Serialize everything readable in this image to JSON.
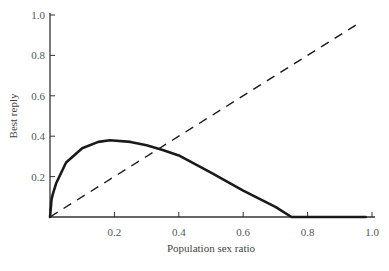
{
  "chart_data": {
    "type": "line",
    "title": "",
    "xlabel": "Population sex ratio",
    "ylabel": "Best reply",
    "xlim": [
      0,
      1.0
    ],
    "ylim": [
      0,
      1.0
    ],
    "grid": false,
    "legend": null,
    "x_ticks": [
      "0.2",
      "0.4",
      "0.6",
      "0.8",
      "1.0"
    ],
    "y_ticks": [
      "0.2",
      "0.4",
      "0.6",
      "0.8",
      "1.0"
    ],
    "series": [
      {
        "name": "Best reply curve",
        "style": "solid-thick",
        "x": [
          0,
          0.005,
          0.01,
          0.02,
          0.05,
          0.1,
          0.15,
          0.186,
          0.25,
          0.3,
          0.35,
          0.4,
          0.5,
          0.6,
          0.7,
          0.75,
          0.8,
          0.9,
          0.98
        ],
        "y": [
          0,
          0.09,
          0.12,
          0.17,
          0.27,
          0.34,
          0.372,
          0.38,
          0.372,
          0.355,
          0.332,
          0.305,
          0.22,
          0.13,
          0.05,
          0,
          0,
          0,
          0
        ]
      },
      {
        "name": "Diagonal (y = x)",
        "style": "dashed",
        "x": [
          0,
          0.96
        ],
        "y": [
          0,
          0.96
        ]
      }
    ]
  }
}
